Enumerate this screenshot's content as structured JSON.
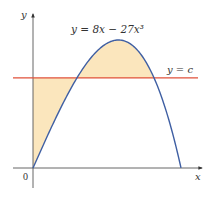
{
  "figure": {
    "curve_equation_label": "y = 8x − 27x³",
    "line_label": "y = c",
    "x_axis_label": "x",
    "y_axis_label": "y",
    "origin_label": "0"
  },
  "colors": {
    "curve": "#3f5fa3",
    "horizontal_line": "#e0503a",
    "shaded_region": "#fbe6bd",
    "axes": "#555555",
    "text": "#333333"
  },
  "chart_data": {
    "type": "line",
    "title": "",
    "function": "y = 8x - 27x^3",
    "horizontal_line": "y = c",
    "c_value_approx": 1.18,
    "x_root": 0.5443,
    "max_point": {
      "x": 0.3143,
      "y": 1.676
    },
    "shaded_regions": [
      "between y-axis, line y=c and curve (0 ≤ x ≤ first intersection)",
      "between curve and line y=c (between intersections, above line)"
    ],
    "xlabel": "x",
    "ylabel": "y",
    "grid": false
  }
}
